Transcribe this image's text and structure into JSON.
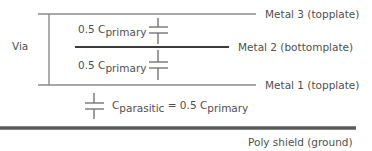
{
  "diagram": {
    "via_label": "Via",
    "layers": [
      {
        "id": "metal3",
        "label": "Metal 3 (topplate)"
      },
      {
        "id": "metal2",
        "label": "Metal 2 (bottomplate)"
      },
      {
        "id": "metal1",
        "label": "Metal 1 (topplate)"
      },
      {
        "id": "poly",
        "label": "Poly shield (ground)"
      }
    ],
    "capacitors": [
      {
        "id": "c-upper",
        "coef": "0.5 C",
        "sub": "primary"
      },
      {
        "id": "c-lower",
        "coef": "0.5 C",
        "sub": "primary"
      },
      {
        "id": "c-parasitic",
        "coef": "C",
        "sub": "parasitic",
        "eq": " = 0.5 C",
        "eq_sub": "primary"
      }
    ],
    "colors": {
      "line": "#6e6e6e",
      "line_dark": "#3c3c3c",
      "text": "#505050"
    }
  }
}
